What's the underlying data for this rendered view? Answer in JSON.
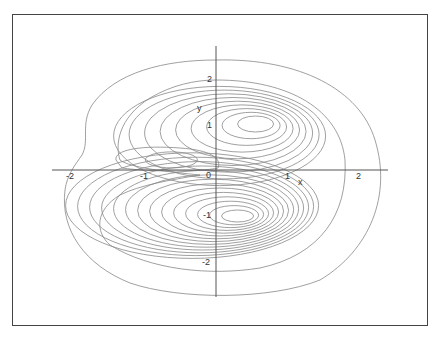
{
  "chart_data": {
    "type": "contour",
    "title": "",
    "xlabel": "x",
    "ylabel": "y",
    "xlim": [
      -2.3,
      2.4
    ],
    "ylim": [
      -2.7,
      2.7
    ],
    "grid": false,
    "legend": null,
    "x_ticks": [
      {
        "value": -2,
        "label": "-2"
      },
      {
        "value": -1,
        "label": "-1"
      },
      {
        "value": 0,
        "label": "0"
      },
      {
        "value": 1,
        "label": "1"
      },
      {
        "value": 2,
        "label": "2"
      }
    ],
    "y_ticks": [
      {
        "value": 2,
        "label": "2"
      },
      {
        "value": 1,
        "label": "1"
      },
      {
        "value": -1,
        "label": "-1"
      },
      {
        "value": -2,
        "label": "-2"
      }
    ],
    "features": {
      "positive_lobe_center": [
        0.55,
        1.0
      ],
      "negative_lobe_center": [
        0.3,
        -1.0
      ],
      "secondary_loop_center": [
        -0.75,
        0.25
      ],
      "outer_contour_extent": {
        "x": [
          -2.05,
          2.3
        ],
        "y": [
          -2.6,
          2.35
        ]
      },
      "contour_count_upper_lobe": 10,
      "contour_count_lower_lobe": 15
    },
    "line_color": "#888888",
    "axis_color": "#555555",
    "frame_color": "#444444"
  }
}
